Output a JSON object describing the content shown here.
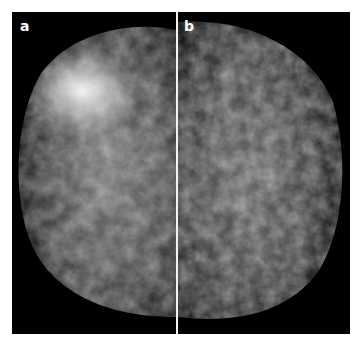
{
  "figure": {
    "panels": [
      {
        "label": "a",
        "description": "grayscale mammogram view, dense bright fibroglandular tissue in upper left"
      },
      {
        "label": "b",
        "description": "grayscale mammogram view, reticular fibroglandular pattern"
      }
    ],
    "colors": {
      "background": "#000000",
      "divider": "#f2f2f2",
      "label": "#ffffff",
      "page": "#ffffff"
    }
  }
}
